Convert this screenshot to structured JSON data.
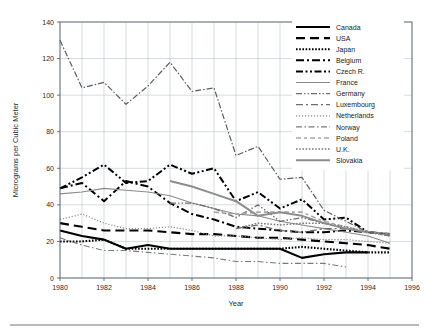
{
  "figure": {
    "width": 429,
    "height": 334,
    "background": "#ffffff",
    "rule_color": "#767676"
  },
  "chart_data": {
    "type": "line",
    "title": "",
    "xlabel": "Year",
    "ylabel": "Micrograms per Cubic Meter",
    "xlim": [
      1980,
      1996
    ],
    "ylim": [
      0,
      140
    ],
    "xticks": [
      1980,
      1982,
      1984,
      1986,
      1988,
      1990,
      1992,
      1994,
      1996
    ],
    "yticks": [
      0,
      20,
      40,
      60,
      80,
      100,
      120,
      140
    ],
    "xtick_labels": [
      "1980",
      "1982",
      "1984",
      "1986",
      "1988",
      "1990",
      "1992",
      "1994",
      "1996"
    ],
    "ytick_labels": [
      "0",
      "20",
      "40",
      "60",
      "80",
      "100",
      "120",
      "140"
    ],
    "grid": true,
    "grid_color": "#b9c2cc",
    "legend_position": "upper-right-inside",
    "series": [
      {
        "name": "Canada",
        "color": "#000000",
        "width": 2.1,
        "dash": "none",
        "x": [
          1980,
          1981,
          1982,
          1983,
          1984,
          1985,
          1986,
          1987,
          1988,
          1989,
          1990,
          1991,
          1992,
          1993,
          1994
        ],
        "values": [
          26,
          23,
          21,
          16,
          18,
          16,
          16,
          16,
          16,
          16,
          16,
          11,
          13,
          14,
          14
        ]
      },
      {
        "name": "USA",
        "color": "#000000",
        "width": 2.1,
        "dash": "9,5",
        "x": [
          1980,
          1981,
          1982,
          1983,
          1984,
          1985,
          1986,
          1987,
          1988,
          1989,
          1990,
          1991,
          1992,
          1993,
          1994,
          1995
        ],
        "values": [
          30,
          28,
          26,
          26,
          26,
          25,
          24,
          24,
          23,
          22,
          22,
          21,
          20,
          19,
          18,
          16
        ]
      },
      {
        "name": "Japan",
        "color": "#000000",
        "width": 2.1,
        "dash": "1.6,1.6",
        "x": [
          1980,
          1981,
          1982,
          1983,
          1984,
          1985,
          1986,
          1987,
          1988,
          1989,
          1990,
          1991,
          1992,
          1993,
          1994,
          1995
        ],
        "values": [
          20,
          20,
          21,
          16,
          16,
          16,
          16,
          16,
          16,
          16,
          16,
          17,
          16,
          15,
          14,
          14
        ]
      },
      {
        "name": "Belgium",
        "color": "#000000",
        "width": 2.0,
        "dash": "8,3,2,3",
        "x": [
          1980,
          1981,
          1982,
          1983,
          1984,
          1985,
          1986,
          1987,
          1988,
          1989,
          1990,
          1991,
          1992,
          1993,
          1994,
          1995
        ],
        "values": [
          49,
          52,
          42,
          53,
          50,
          41,
          35,
          32,
          28,
          27,
          26,
          25,
          25,
          26,
          25,
          24
        ]
      },
      {
        "name": "Czech R.",
        "color": "#000000",
        "width": 2.0,
        "dash": "7,2.5,2,2.5,2,2.5",
        "x": [
          1980,
          1981,
          1982,
          1983,
          1984,
          1985,
          1986,
          1987,
          1988,
          1989,
          1990,
          1991,
          1992,
          1993,
          1994,
          1995
        ],
        "values": [
          49,
          55,
          62,
          52,
          53,
          62,
          57,
          60,
          42,
          47,
          38,
          43,
          32,
          33,
          25,
          24
        ]
      },
      {
        "name": "France",
        "color": "#8a8a8a",
        "width": 1.1,
        "dash": "none",
        "x": [
          1980,
          1981,
          1982,
          1983,
          1984,
          1985,
          1986,
          1987,
          1988,
          1989,
          1990,
          1991,
          1992,
          1993,
          1994,
          1995
        ],
        "values": [
          46,
          47,
          49,
          48,
          47,
          45,
          41,
          38,
          35,
          34,
          31,
          29,
          27,
          25,
          23,
          19
        ]
      },
      {
        "name": "Germany",
        "color": "#6e6e6e",
        "width": 1.3,
        "dash": "6,2,1.5,2,1.5,2",
        "x": [
          1985,
          1986,
          1987,
          1988,
          1989,
          1990,
          1991,
          1992,
          1993,
          1994,
          1995
        ],
        "values": [
          41,
          41,
          38,
          33,
          40,
          31,
          33,
          30,
          27,
          25,
          24
        ]
      },
      {
        "name": "Luxembourg",
        "color": "#6e6e6e",
        "width": 1.3,
        "dash": "7,3,2,3",
        "x": [
          1988,
          1989,
          1990,
          1991,
          1992,
          1993,
          1994,
          1995
        ],
        "values": [
          27,
          29,
          26,
          25,
          27,
          27,
          25,
          23
        ]
      },
      {
        "name": "Netherlands",
        "color": "#8a8a8a",
        "width": 1.2,
        "dash": "1.2,1.8",
        "x": [
          1980,
          1981,
          1982,
          1983,
          1984,
          1985,
          1986,
          1987,
          1988,
          1989,
          1990,
          1991,
          1992,
          1993,
          1994,
          1995
        ],
        "values": [
          32,
          35,
          30,
          27,
          27,
          28,
          26,
          23,
          23,
          22,
          21,
          22,
          21,
          21,
          20,
          19
        ]
      },
      {
        "name": "Norway",
        "color": "#7a7a7a",
        "width": 1.1,
        "dash": "6,2.5,1.5,2.5",
        "x": [
          1980,
          1981,
          1982,
          1983,
          1984,
          1985,
          1986,
          1987,
          1988,
          1989,
          1990,
          1991,
          1992,
          1993
        ],
        "values": [
          22,
          18,
          15,
          15,
          14,
          13,
          12,
          11,
          9,
          9,
          8,
          8,
          8,
          6
        ]
      },
      {
        "name": "Poland",
        "color": "#a8a8a8",
        "width": 1.6,
        "dash": "5,3,3,3",
        "x": [
          1987,
          1988,
          1989,
          1990,
          1991,
          1992,
          1993,
          1994,
          1995
        ],
        "values": [
          36,
          35,
          36,
          36,
          36,
          31,
          28,
          25,
          24
        ]
      },
      {
        "name": "U.K.",
        "color": "#7a7a7a",
        "width": 1.5,
        "dash": "1.6,1.6",
        "x": [
          1988,
          1989,
          1990,
          1991,
          1992,
          1993,
          1994,
          1995
        ],
        "values": [
          27,
          30,
          29,
          30,
          30,
          28,
          25,
          23
        ]
      },
      {
        "name": "Slovakia",
        "color": "#8d8d8d",
        "width": 2.0,
        "dash": "none",
        "x": [
          1985,
          1986,
          1987,
          1988,
          1989,
          1990,
          1991,
          1992,
          1993,
          1994,
          1995
        ],
        "values": [
          53,
          50,
          46,
          42,
          34,
          36,
          34,
          30,
          27,
          25,
          24
        ]
      },
      {
        "name": "Poland-high",
        "color": "#5d5d5d",
        "width": 1.2,
        "dash": "6,2,1.5,2",
        "x": [
          1980,
          1981,
          1982,
          1983,
          1984,
          1985,
          1986,
          1987,
          1988,
          1989,
          1990,
          1991,
          1992,
          1993,
          1994,
          1995
        ],
        "values": [
          130,
          104,
          107,
          95,
          105,
          118,
          102,
          104,
          67,
          72,
          54,
          55,
          37,
          31,
          25,
          24
        ],
        "hidden_from_legend": true
      }
    ],
    "legend_entries": [
      {
        "label": "Canada"
      },
      {
        "label": "USA"
      },
      {
        "label": "Japan"
      },
      {
        "label": "Belgium"
      },
      {
        "label": "Czech R."
      },
      {
        "label": "France"
      },
      {
        "label": "Germany"
      },
      {
        "label": "Luxembourg"
      },
      {
        "label": "Netherlands"
      },
      {
        "label": "Norway"
      },
      {
        "label": "Poland"
      },
      {
        "label": "U.K."
      },
      {
        "label": "Slovakia"
      }
    ]
  }
}
